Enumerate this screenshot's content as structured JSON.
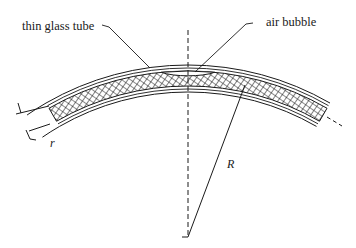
{
  "diagram": {
    "labels": {
      "tube": "thin glass tube",
      "bubble": "air bubble",
      "radius_large": "R",
      "radius_small": "r"
    },
    "colors": {
      "ink": "#1a1a1a",
      "background": "#ffffff"
    },
    "geometry": {
      "center_x": 188,
      "center_y": 349,
      "outer_radius": 284,
      "glass_inner_outer_radius": 281,
      "fluid_outer_radius": 278,
      "fluid_inner_radius": 263,
      "glass_inner_inner_radius": 260,
      "inner_radius": 257,
      "arc_start_deg": -120,
      "arc_end_deg": -60,
      "axis_top_y": 30,
      "axis_bottom_y": 237,
      "r_line_end": [
        245,
        85
      ]
    }
  }
}
